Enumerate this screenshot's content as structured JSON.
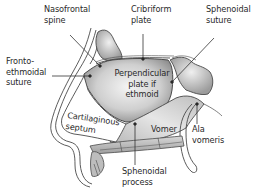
{
  "diagram": {
    "title": "",
    "labels": {
      "nasofrontal_spine": "Nasofrontal\nspine",
      "cribriform_plate": "Cribriform\nplate",
      "sphenoidal_suture": "Sphenoidal\nsuture",
      "frontoethmoidal_suture": "Fronto-\nethmoidal\nsuture",
      "perpendicular_plate": "Perpendicular\nplate if\nethmoid",
      "cartilaginous_septum": "Cartilaginous\nseptum",
      "vomer": "Vomer",
      "ala_vomeris": "Ala\nvomeris",
      "sphenoidal_process": "Sphenoidal\nprocess"
    },
    "colors": {
      "outline": "#4a4a4a",
      "bone_fill_light": "#f2f2f2",
      "bone_fill_dark": "#9a9a9a",
      "leader_line": "#333333",
      "background": "#ffffff"
    }
  }
}
